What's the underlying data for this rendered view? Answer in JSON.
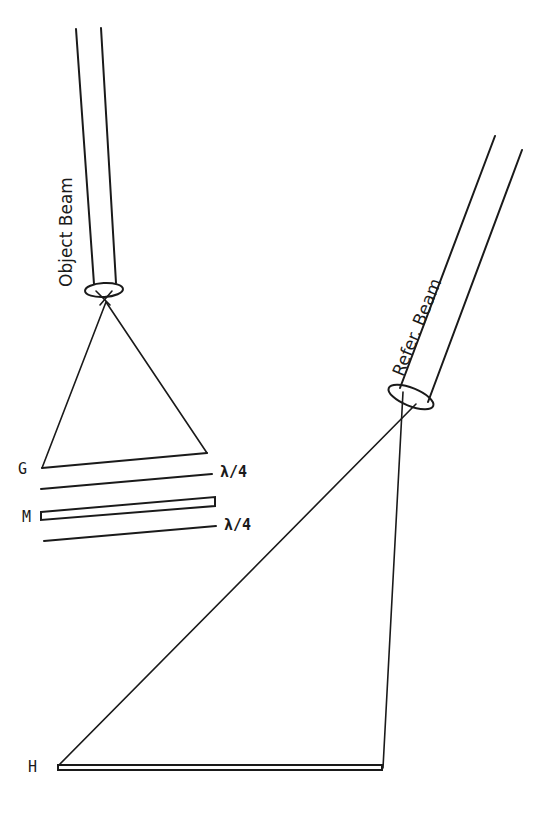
{
  "diagram": {
    "type": "optical holography setup",
    "stroke_color": "#1a1a1a",
    "background": "#ffffff",
    "labels": {
      "object_beam": "Object Beam",
      "reference_beam": "Refer. Beam",
      "grating": "G",
      "mirror": "M",
      "hologram": "H",
      "quarter_wave_1": "λ/4",
      "quarter_wave_2": "λ/4"
    },
    "components": [
      {
        "id": "object-beam",
        "label": "Object Beam",
        "kind": "collimated beam"
      },
      {
        "id": "object-lens",
        "kind": "lens"
      },
      {
        "id": "grating-G",
        "label": "G",
        "kind": "plate"
      },
      {
        "id": "waveplate-1",
        "label": "λ/4",
        "kind": "quarter-wave plate"
      },
      {
        "id": "mirror-M",
        "label": "M",
        "kind": "mirror"
      },
      {
        "id": "waveplate-2",
        "label": "λ/4",
        "kind": "quarter-wave plate"
      },
      {
        "id": "reference-beam",
        "label": "Refer. Beam",
        "kind": "collimated beam"
      },
      {
        "id": "reference-lens",
        "kind": "lens"
      },
      {
        "id": "hologram-H",
        "label": "H",
        "kind": "recording plate"
      }
    ]
  }
}
